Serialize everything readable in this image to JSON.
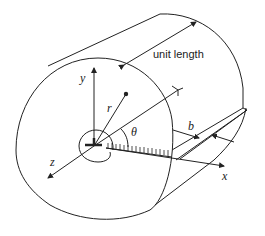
{
  "diagram": {
    "labels": {
      "unit_length": "unit length",
      "y_axis": "y",
      "z_axis": "z",
      "x_axis": "x",
      "radius": "r",
      "angle": "θ",
      "crack_width": "b"
    },
    "colors": {
      "stroke": "#222222",
      "background": "#ffffff"
    }
  }
}
